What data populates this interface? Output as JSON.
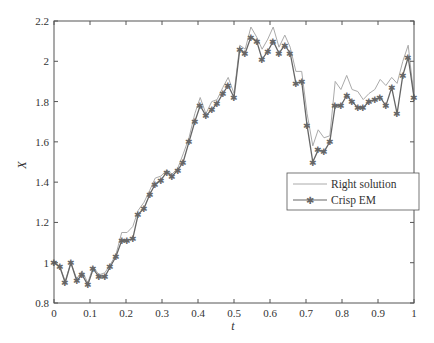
{
  "chart_data": {
    "type": "line",
    "title": "",
    "xlabel": "t",
    "ylabel": "X",
    "xlim": [
      0,
      1
    ],
    "ylim": [
      0.8,
      2.2
    ],
    "xticks": [
      "0",
      "0.1",
      "0.2",
      "0.3",
      "0.4",
      "0.5",
      "0.6",
      "0.7",
      "0.8",
      "0.9",
      "1"
    ],
    "yticks": [
      "0.8",
      "1",
      "1.2",
      "1.4",
      "1.6",
      "1.8",
      "2",
      "2.2"
    ],
    "grid": false,
    "legend_position": "center-right",
    "x": [
      0,
      0.016,
      0.031,
      0.047,
      0.063,
      0.078,
      0.094,
      0.109,
      0.125,
      0.141,
      0.156,
      0.172,
      0.188,
      0.203,
      0.219,
      0.234,
      0.25,
      0.266,
      0.281,
      0.297,
      0.313,
      0.328,
      0.344,
      0.359,
      0.375,
      0.391,
      0.406,
      0.422,
      0.438,
      0.453,
      0.469,
      0.484,
      0.5,
      0.516,
      0.531,
      0.547,
      0.563,
      0.578,
      0.594,
      0.609,
      0.625,
      0.641,
      0.656,
      0.672,
      0.688,
      0.703,
      0.719,
      0.734,
      0.75,
      0.766,
      0.781,
      0.797,
      0.813,
      0.828,
      0.844,
      0.859,
      0.875,
      0.891,
      0.906,
      0.922,
      0.938,
      0.953,
      0.969,
      0.984,
      1.0
    ],
    "series": [
      {
        "name": "Right solution",
        "color": "#aaaaaa",
        "marker": "none",
        "values": [
          1.0,
          0.98,
          0.91,
          1.0,
          0.92,
          0.96,
          0.9,
          0.98,
          0.94,
          0.95,
          0.99,
          1.04,
          1.15,
          1.15,
          1.18,
          1.26,
          1.3,
          1.36,
          1.42,
          1.43,
          1.46,
          1.44,
          1.47,
          1.54,
          1.62,
          1.74,
          1.82,
          1.74,
          1.8,
          1.81,
          1.87,
          1.92,
          1.84,
          2.08,
          2.06,
          2.17,
          2.12,
          2.06,
          2.11,
          2.17,
          2.07,
          2.13,
          2.07,
          1.95,
          1.95,
          1.74,
          1.58,
          1.66,
          1.62,
          1.63,
          1.9,
          1.86,
          1.93,
          1.86,
          1.85,
          1.81,
          1.84,
          1.86,
          1.91,
          1.88,
          1.92,
          1.89,
          2.0,
          2.08,
          1.82
        ]
      },
      {
        "name": "Crisp EM",
        "color": "#666666",
        "marker": "*",
        "values": [
          1.0,
          0.98,
          0.9,
          1.0,
          0.91,
          0.94,
          0.89,
          0.97,
          0.93,
          0.93,
          0.98,
          1.03,
          1.11,
          1.11,
          1.12,
          1.24,
          1.27,
          1.34,
          1.39,
          1.41,
          1.45,
          1.43,
          1.46,
          1.5,
          1.6,
          1.7,
          1.78,
          1.73,
          1.76,
          1.79,
          1.84,
          1.88,
          1.82,
          2.06,
          2.04,
          2.12,
          2.1,
          2.01,
          2.05,
          2.1,
          2.04,
          2.08,
          2.04,
          1.89,
          1.9,
          1.68,
          1.5,
          1.56,
          1.55,
          1.6,
          1.78,
          1.78,
          1.83,
          1.8,
          1.77,
          1.77,
          1.8,
          1.81,
          1.82,
          1.78,
          1.87,
          1.74,
          1.93,
          2.02,
          1.82
        ]
      }
    ]
  },
  "legend": {
    "items": [
      {
        "label": "Right solution"
      },
      {
        "label": "Crisp EM"
      }
    ]
  },
  "axes": {
    "xlabel": "t",
    "ylabel": "X"
  }
}
